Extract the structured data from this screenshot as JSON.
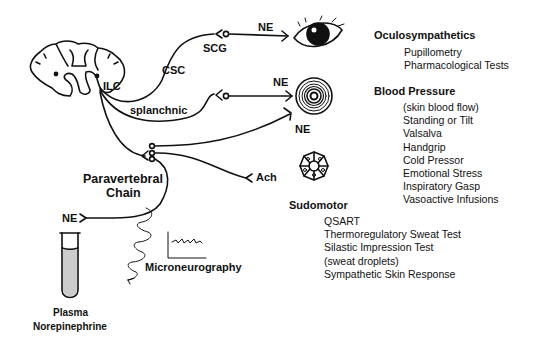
{
  "labels": {
    "ilc": "ILC",
    "csc": "CSC",
    "scg": "SCG",
    "splanchnic": "splanchnic",
    "ne_eye": "NE",
    "ne_vessel": "NE",
    "ne_skin_vessel": "NE",
    "ach": "Ach",
    "ne_plasma": "NE",
    "paravertebral_line1": "Paravertebral",
    "paravertebral_line2": "Chain",
    "microneurography": "Microneurography",
    "plasma_line1": "Plasma",
    "plasma_line2": "Norepinephrine",
    "sudomotor": "Sudomotor"
  },
  "tests": {
    "oculosympathetics": {
      "heading": "Oculosympathetics",
      "items": [
        "Pupillometry",
        "Pharmacological Tests"
      ]
    },
    "blood_pressure": {
      "heading": "Blood Pressure",
      "items": [
        "(skin blood flow)",
        "Standing or Tilt",
        "Valsalva",
        "Handgrip",
        "Cold Pressor",
        "Emotional Stress",
        "Inspiratory Gasp",
        "Vasoactive Infusions"
      ]
    },
    "sudomotor": {
      "items": [
        "QSART",
        "Thermoregulatory Sweat Test",
        "Silastic Impression Test",
        "(sweat droplets)",
        "Sympathetic Skin Response"
      ]
    }
  },
  "icons": {
    "spinal_cord": "spinal-cord-cross-section",
    "eye": "eye",
    "blood_vessel": "blood-vessel-cross-section",
    "sweat_gland": "sweat-gland",
    "test_tube": "test-tube",
    "electrode": "coiled-electrode",
    "trace": "nerve-recording-trace"
  },
  "colors": {
    "ink": "#111111",
    "background": "#ffffff"
  }
}
